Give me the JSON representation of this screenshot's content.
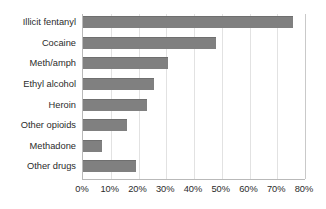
{
  "chart_data": {
    "type": "bar",
    "orientation": "horizontal",
    "title": "",
    "xlabel": "",
    "ylabel": "",
    "categories": [
      "Illicit fentanyl",
      "Cocaine",
      "Meth/amph",
      "Ethyl alcohol",
      "Heroin",
      "Other opioids",
      "Methadone",
      "Other drugs"
    ],
    "values": [
      75.5,
      48,
      30.5,
      25.5,
      23,
      16,
      7,
      19
    ],
    "value_unit": "%",
    "xlim": [
      0,
      80
    ],
    "xticks": [
      0,
      10,
      20,
      30,
      40,
      50,
      60,
      70,
      80
    ],
    "xtick_labels": [
      "0%",
      "10%",
      "20%",
      "30%",
      "40%",
      "50%",
      "60%",
      "70%",
      "80%"
    ],
    "grid": "vertical",
    "legend": "none",
    "bar_color": "#808080",
    "gridline_color": "#e2e2e2",
    "axis_color": "#b9b9b9",
    "text_color": "#2b2b2b",
    "background_color": "#ffffff"
  }
}
